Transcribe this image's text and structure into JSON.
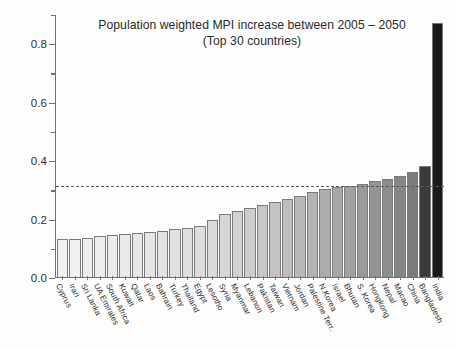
{
  "chart_data": {
    "type": "bar",
    "title": "Population weighted MPI increase between 2005 – 2050",
    "subtitle": "(Top 30 countries)",
    "xlabel": "",
    "ylabel": "",
    "ylim": [
      0.0,
      0.9
    ],
    "grid": false,
    "legend": "none",
    "y_ticks_major": [
      "0.0",
      "0.2",
      "0.4",
      "0.6",
      "0.8"
    ],
    "y_tick_values_major": [
      0.0,
      0.2,
      0.4,
      0.6,
      0.8
    ],
    "y_tick_values_minor": [
      0.1,
      0.3,
      0.5,
      0.7,
      0.9
    ],
    "annotations": [
      {
        "name": "threshold-dashed-line",
        "type": "horizontal-dashed-line",
        "value": 0.315
      }
    ],
    "categories": [
      "Cyprus",
      "Iran",
      "Sri Lanka",
      "UA Emirates",
      "South Africa",
      "Kuwait",
      "Qatar",
      "Laos",
      "Bahrain",
      "Turkey",
      "Thailand",
      "Egypt",
      "Lesotho",
      "Syria",
      "Myanmar",
      "Lebanon",
      "Pakistan",
      "Taiwan",
      "Vietnam",
      "Jordan",
      "Palestine Terr.",
      "N.Korea",
      "Israel",
      "Bhutan",
      "S. Korea",
      "Hongkong",
      "Nepal",
      "Macao",
      "China",
      "Bangladesh",
      "India"
    ],
    "values": [
      0.13,
      0.131,
      0.134,
      0.139,
      0.143,
      0.147,
      0.15,
      0.154,
      0.158,
      0.163,
      0.168,
      0.175,
      0.196,
      0.214,
      0.225,
      0.236,
      0.247,
      0.256,
      0.266,
      0.276,
      0.29,
      0.3,
      0.307,
      0.312,
      0.318,
      0.33,
      0.335,
      0.345,
      0.36,
      0.38,
      0.868
    ],
    "bar_colors": [
      "#f1f1f1",
      "#f0f0f0",
      "#efefef",
      "#ededed",
      "#ebebeb",
      "#e9e9e9",
      "#e7e7e7",
      "#e5e5e5",
      "#e3e3e3",
      "#e1e1e1",
      "#dfdfdf",
      "#dddddd",
      "#dadada",
      "#d6d6d6",
      "#d2d2d2",
      "#cdcdcd",
      "#c8c8c8",
      "#c3c3c3",
      "#bebebe",
      "#b9b9b9",
      "#b3b3b3",
      "#adadad",
      "#a7a7a7",
      "#a1a1a1",
      "#9a9a9a",
      "#949494",
      "#8d8d8d",
      "#868686",
      "#7c7c7c",
      "#3a3a3a",
      "#1b1b1b"
    ]
  },
  "axis": {
    "baseline_value": 0.0,
    "top_value": 0.9
  }
}
